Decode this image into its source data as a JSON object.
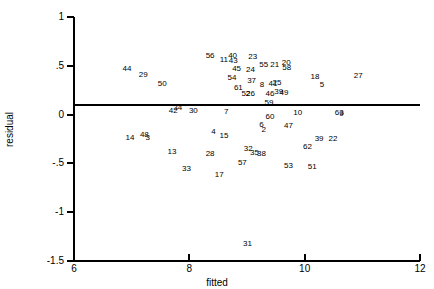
{
  "chart_data": {
    "type": "scatter",
    "title": "",
    "xlabel": "fitted",
    "ylabel": "residual",
    "xlim": [
      6,
      12
    ],
    "ylim": [
      -1.5,
      1
    ],
    "xticks": [
      6,
      8,
      10,
      12
    ],
    "xticklabels": [
      "6",
      "8",
      "10",
      "12"
    ],
    "yticks": [
      1,
      0.5,
      0,
      -0.5,
      -1,
      -1.5
    ],
    "yticklabels": [
      "1",
      ".5",
      "0",
      "-.5",
      "-1",
      "-1.5"
    ],
    "grid": false,
    "legend": null,
    "reference_line": {
      "orientation": "horizontal",
      "y": 0,
      "style": "solid",
      "color": "#000000"
    },
    "marker_style": "point-index-label",
    "points": [
      {
        "label": "44",
        "x": 6.92,
        "y": 0.47
      },
      {
        "label": "29",
        "x": 7.2,
        "y": 0.41
      },
      {
        "label": "50",
        "x": 7.53,
        "y": 0.31
      },
      {
        "label": "42",
        "x": 7.72,
        "y": 0.04
      },
      {
        "label": "34",
        "x": 7.8,
        "y": 0.07
      },
      {
        "label": "30",
        "x": 8.07,
        "y": 0.04
      },
      {
        "label": "56",
        "x": 8.36,
        "y": 0.6
      },
      {
        "label": "11",
        "x": 8.6,
        "y": 0.56
      },
      {
        "label": "40",
        "x": 8.75,
        "y": 0.6
      },
      {
        "label": "43",
        "x": 8.76,
        "y": 0.55
      },
      {
        "label": "23",
        "x": 9.1,
        "y": 0.59
      },
      {
        "label": "45",
        "x": 8.82,
        "y": 0.47
      },
      {
        "label": "24",
        "x": 9.06,
        "y": 0.46
      },
      {
        "label": "55",
        "x": 9.29,
        "y": 0.51
      },
      {
        "label": "21",
        "x": 9.48,
        "y": 0.51
      },
      {
        "label": "20",
        "x": 9.68,
        "y": 0.53
      },
      {
        "label": "58",
        "x": 9.69,
        "y": 0.48
      },
      {
        "label": "54",
        "x": 8.74,
        "y": 0.38
      },
      {
        "label": "37",
        "x": 9.08,
        "y": 0.34
      },
      {
        "label": "8",
        "x": 9.26,
        "y": 0.3
      },
      {
        "label": "61",
        "x": 8.85,
        "y": 0.27
      },
      {
        "label": "52",
        "x": 8.98,
        "y": 0.21
      },
      {
        "label": "26",
        "x": 9.06,
        "y": 0.21
      },
      {
        "label": "25",
        "x": 9.52,
        "y": 0.32
      },
      {
        "label": "41",
        "x": 9.45,
        "y": 0.31
      },
      {
        "label": "46",
        "x": 9.4,
        "y": 0.21
      },
      {
        "label": "39b",
        "x": 9.55,
        "y": 0.23
      },
      {
        "label": "49",
        "x": 9.64,
        "y": 0.22
      },
      {
        "label": "59",
        "x": 9.38,
        "y": 0.12
      },
      {
        "label": "18",
        "x": 10.18,
        "y": 0.39
      },
      {
        "label": "5",
        "x": 10.3,
        "y": 0.3
      },
      {
        "label": "27",
        "x": 10.93,
        "y": 0.4
      },
      {
        "label": "7",
        "x": 8.64,
        "y": 0.03
      },
      {
        "label": "60",
        "x": 9.4,
        "y": -0.02
      },
      {
        "label": "10",
        "x": 9.88,
        "y": 0.02
      },
      {
        "label": "63",
        "x": 10.6,
        "y": 0.02
      },
      {
        "label": "9",
        "x": 10.64,
        "y": 0.01
      },
      {
        "label": "47",
        "x": 9.72,
        "y": -0.12
      },
      {
        "label": "14",
        "x": 6.97,
        "y": -0.24
      },
      {
        "label": "48",
        "x": 7.22,
        "y": -0.21
      },
      {
        "label": "3",
        "x": 7.28,
        "y": -0.24
      },
      {
        "label": "4",
        "x": 8.42,
        "y": -0.18
      },
      {
        "label": "15",
        "x": 8.6,
        "y": -0.22
      },
      {
        "label": "6",
        "x": 9.25,
        "y": -0.11
      },
      {
        "label": "2",
        "x": 9.29,
        "y": -0.16
      },
      {
        "label": "39",
        "x": 10.25,
        "y": -0.25
      },
      {
        "label": "22",
        "x": 10.49,
        "y": -0.25
      },
      {
        "label": "13",
        "x": 7.7,
        "y": -0.38
      },
      {
        "label": "28",
        "x": 8.36,
        "y": -0.4
      },
      {
        "label": "32",
        "x": 9.02,
        "y": -0.35
      },
      {
        "label": "35",
        "x": 9.13,
        "y": -0.39
      },
      {
        "label": "38",
        "x": 9.25,
        "y": -0.4
      },
      {
        "label": "62",
        "x": 10.05,
        "y": -0.33
      },
      {
        "label": "33",
        "x": 7.95,
        "y": -0.56
      },
      {
        "label": "57",
        "x": 8.92,
        "y": -0.5
      },
      {
        "label": "17",
        "x": 8.52,
        "y": -0.62
      },
      {
        "label": "53",
        "x": 9.72,
        "y": -0.53
      },
      {
        "label": "51",
        "x": 10.13,
        "y": -0.54
      },
      {
        "label": "31",
        "x": 9.01,
        "y": -1.33
      }
    ]
  }
}
